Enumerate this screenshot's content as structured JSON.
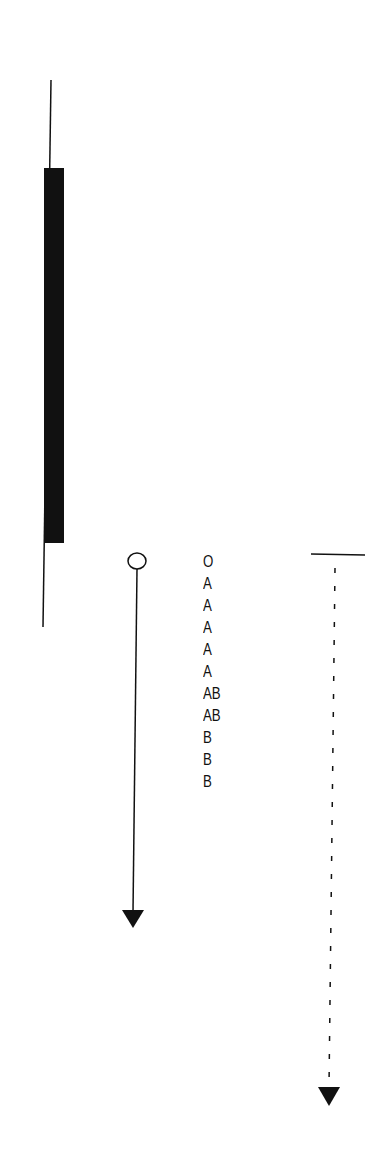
{
  "diagram": {
    "left_marker": {
      "line_top_y": 80,
      "bar_top_y": 168,
      "bar_bottom_y": 543,
      "line_bottom_y": 627,
      "color": "#111111"
    },
    "arrow": {
      "start_symbol": "open-circle",
      "end_symbol": "filled-triangle",
      "style": "solid"
    },
    "labels": [
      "O",
      "A",
      "A",
      "A",
      "A",
      "A",
      "AB",
      "AB",
      "B",
      "B",
      "B"
    ],
    "dashed_arrow": {
      "start_symbol": "horizontal-bar",
      "end_symbol": "filled-triangle",
      "style": "dashed"
    }
  }
}
